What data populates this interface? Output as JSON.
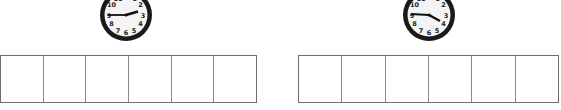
{
  "exercises": [
    {
      "clock": {
        "hour": 2,
        "minute": 45,
        "numerals": [
          "12",
          "1",
          "2",
          "3",
          "4",
          "5",
          "6",
          "7",
          "8",
          "9",
          "10",
          "11"
        ]
      },
      "answer_grid": {
        "cells": [
          "",
          "",
          "",
          "",
          "",
          ""
        ]
      }
    },
    {
      "clock": {
        "hour": 3,
        "minute": 45,
        "numerals": [
          "12",
          "1",
          "2",
          "3",
          "4",
          "5",
          "6",
          "7",
          "8",
          "9",
          "10",
          "11"
        ]
      },
      "answer_grid": {
        "cells": [
          "",
          "",
          "",
          "",
          "",
          ""
        ]
      }
    }
  ],
  "colors": {
    "clock_rim": "#1a1a1a",
    "clock_face": "#f4f4f4",
    "grid_line": "#777777"
  }
}
